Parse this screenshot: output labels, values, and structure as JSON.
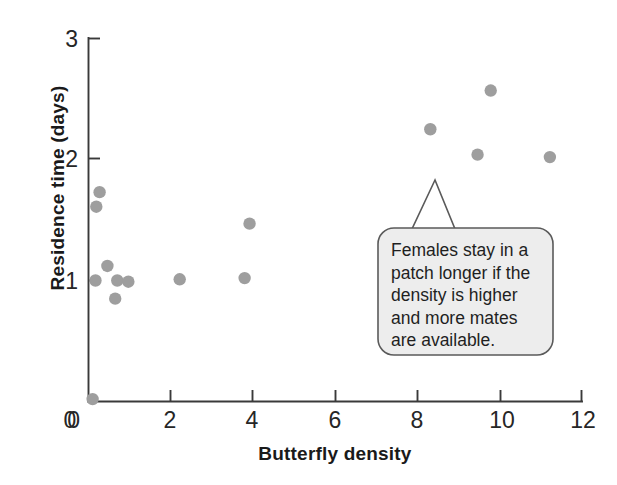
{
  "chart_data": {
    "type": "scatter",
    "title": "",
    "xlabel": "Butterfly density",
    "ylabel": "Residence time (days)",
    "xlim": [
      0,
      12
    ],
    "ylim": [
      0,
      3
    ],
    "xticks": [
      0,
      2,
      4,
      6,
      8,
      10,
      12
    ],
    "yticks": [
      0,
      1,
      2,
      3
    ],
    "xtick_labels": [
      "0",
      "2",
      "4",
      "6",
      "8",
      "10",
      "12"
    ],
    "ytick_labels": [
      "0",
      "1",
      "2",
      "3"
    ],
    "grid": false,
    "legend": null,
    "point_color": "#9e9e9e",
    "series": [
      {
        "name": "Butterfly patch observations",
        "points": [
          {
            "x": 0.1,
            "y": 0.02
          },
          {
            "x": 0.27,
            "y": 1.73
          },
          {
            "x": 0.19,
            "y": 1.61
          },
          {
            "x": 0.46,
            "y": 1.12
          },
          {
            "x": 0.17,
            "y": 1.0
          },
          {
            "x": 0.7,
            "y": 1.0
          },
          {
            "x": 0.97,
            "y": 0.99
          },
          {
            "x": 0.65,
            "y": 0.85
          },
          {
            "x": 2.22,
            "y": 1.01
          },
          {
            "x": 3.8,
            "y": 1.02
          },
          {
            "x": 3.92,
            "y": 1.47
          },
          {
            "x": 8.32,
            "y": 2.25
          },
          {
            "x": 9.79,
            "y": 2.57
          },
          {
            "x": 9.47,
            "y": 2.04
          },
          {
            "x": 11.23,
            "y": 2.02
          }
        ]
      }
    ],
    "annotations": [
      {
        "kind": "callout-bubble",
        "lines": [
          "Females stay in a",
          "patch longer if the",
          "density is higher",
          "and more mates",
          "are available."
        ],
        "points_to": {
          "x": 8.4,
          "y": 1.85
        },
        "fill": "#ededed",
        "stroke": "#5a5a5a"
      }
    ]
  }
}
